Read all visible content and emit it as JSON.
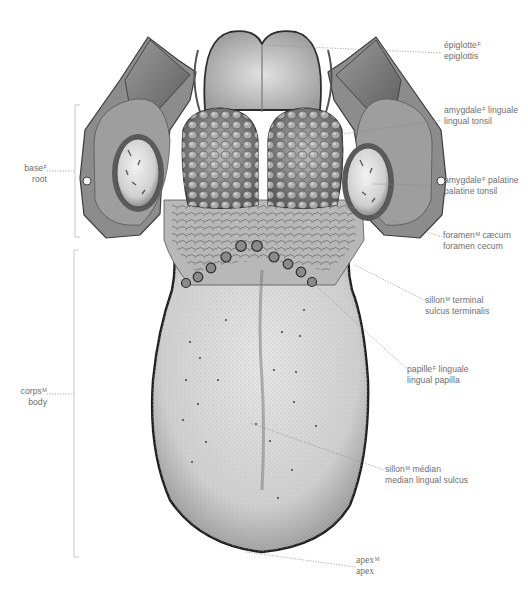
{
  "diagram": {
    "colors": {
      "background": "#ffffff",
      "label_text": "#6e6e6e",
      "leader_line": "#8a8a8a",
      "bracket_line": "#c8c8c8",
      "tissue_light": "#d9d9d9",
      "tissue_mid": "#a7a7a7",
      "tissue_dark": "#3c3c3c"
    },
    "labels": {
      "epiglottis": {
        "fr": "épiglotte",
        "gender": "F",
        "en": "epiglottis"
      },
      "lingual_tonsil": {
        "fr": "amygdale",
        "gender": "F",
        "fr_suffix": " linguale",
        "en": "lingual tonsil"
      },
      "palatine_tonsil": {
        "fr": "amygdale",
        "gender": "F",
        "fr_suffix": " palatine",
        "en": "palatine tonsil"
      },
      "foramen_cecum": {
        "fr": "foramen",
        "gender": "M",
        "fr_suffix": " cæcum",
        "en": "foramen cecum"
      },
      "sulcus_terminalis": {
        "fr": "sillon",
        "gender": "M",
        "fr_suffix": " terminal",
        "en": "sulcus terminalis"
      },
      "lingual_papilla": {
        "fr": "papille",
        "gender": "F",
        "fr_suffix": " linguale",
        "en": "lingual papilla"
      },
      "median_lingual_sulcus": {
        "fr": "sillon",
        "gender": "M",
        "fr_suffix": " médian",
        "en": "median lingual sulcus"
      },
      "apex": {
        "fr": "apex",
        "gender": "M",
        "en": "apex"
      },
      "root": {
        "fr": "base",
        "gender": "F",
        "en": "root"
      },
      "body": {
        "fr": "corps",
        "gender": "M",
        "en": "body"
      }
    }
  }
}
